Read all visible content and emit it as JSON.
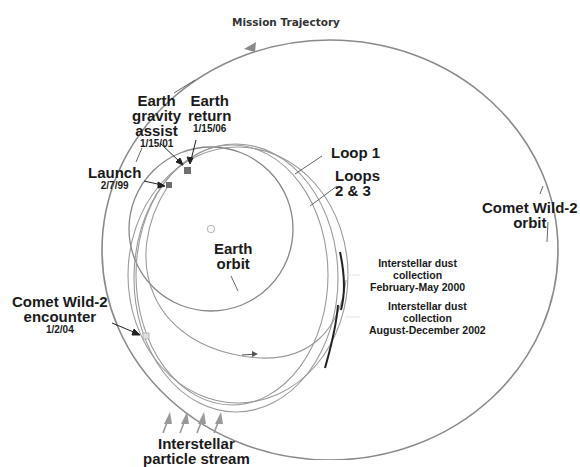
{
  "title": "Mission Trajectory",
  "labels": {
    "earth_gravity_assist": {
      "line1": "Earth",
      "line2": "gravity",
      "line3": "assist",
      "date": "1/15/01"
    },
    "earth_return": {
      "line1": "Earth",
      "line2": "return",
      "date": "1/15/06"
    },
    "launch": {
      "name": "Launch",
      "date": "2/7/99"
    },
    "loop1": "Loop 1",
    "loops23": {
      "line1": "Loops",
      "line2": "2 & 3"
    },
    "comet_orbit": {
      "line1": "Comet Wild-2",
      "line2": "orbit"
    },
    "earth_orbit": {
      "line1": "Earth",
      "line2": "orbit"
    },
    "dust1": {
      "line1": "Interstellar dust",
      "line2": "collection",
      "line3": "February-May 2000"
    },
    "dust2": {
      "line1": "Interstellar dust",
      "line2": "collection",
      "line3": "August-December 2002"
    },
    "encounter": {
      "line1": "Comet Wild-2",
      "line2": "encounter",
      "date": "1/2/04"
    },
    "particle_stream": {
      "line1": "Interstellar",
      "line2": "particle stream"
    }
  },
  "colors": {
    "orbit": "#8a8a8a",
    "trajectory": "#9a9a9a",
    "marker": "#6e6e6e",
    "dust_segment": "#222222",
    "text": "#1a1a1a"
  }
}
